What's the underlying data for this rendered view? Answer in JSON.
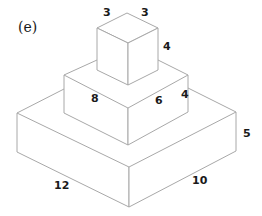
{
  "figure": {
    "panel_label": "(e)",
    "blocks": [
      {
        "name": "top-cube",
        "dimensions": {
          "left_edge": "3",
          "right_edge": "3",
          "height": "4"
        }
      },
      {
        "name": "middle-box",
        "dimensions": {
          "left_edge": "8",
          "right_edge": "6",
          "height": "4"
        }
      },
      {
        "name": "bottom-box",
        "dimensions": {
          "left_edge": "12",
          "right_edge": "10",
          "height": "5"
        }
      }
    ]
  },
  "colors": {
    "line": "#a8a8a8",
    "text": "#1a1a1a",
    "background": "#ffffff"
  }
}
